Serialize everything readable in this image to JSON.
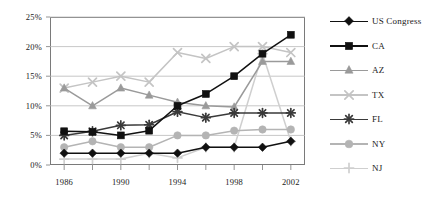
{
  "chart_data": {
    "type": "line",
    "title": "",
    "xlabel": "",
    "ylabel": "",
    "xlim": [
      1985,
      2003
    ],
    "ylim": [
      0,
      25
    ],
    "grid": true,
    "legend_position": "right",
    "x": [
      1986,
      1988,
      1990,
      1992,
      1994,
      1996,
      1998,
      2000,
      2002
    ],
    "xtick_labels": [
      "1986",
      "1990",
      "1994",
      "1998",
      "2002"
    ],
    "xtick_values": [
      1986,
      1990,
      1994,
      1998,
      2002
    ],
    "ytick_labels": [
      "0%",
      "5%",
      "10%",
      "15%",
      "20%",
      "25%"
    ],
    "ytick_values": [
      0,
      5,
      10,
      15,
      20,
      25
    ],
    "series": [
      {
        "name": "US Congress",
        "color": "#111111",
        "marker": "diamond",
        "values": [
          2.0,
          2.0,
          2.0,
          2.0,
          2.0,
          3.0,
          3.0,
          3.0,
          4.0
        ]
      },
      {
        "name": "CA",
        "color": "#111111",
        "marker": "square",
        "values": [
          5.7,
          5.6,
          5.0,
          5.8,
          10.0,
          12.0,
          15.0,
          18.8,
          22.0
        ]
      },
      {
        "name": "AZ",
        "color": "#9a9a9a",
        "marker": "triangle",
        "values": [
          13.0,
          10.0,
          13.0,
          11.8,
          10.6,
          10.0,
          9.8,
          17.5,
          17.5
        ]
      },
      {
        "name": "TX",
        "color": "#c4c4c4",
        "marker": "cross-x",
        "values": [
          13.0,
          14.0,
          15.0,
          14.0,
          19.0,
          18.0,
          20.0,
          20.0,
          19.0
        ]
      },
      {
        "name": "FL",
        "color": "#3a3a3a",
        "marker": "asterisk",
        "values": [
          5.0,
          5.7,
          6.7,
          6.8,
          9.0,
          8.0,
          8.8,
          8.8,
          8.8
        ]
      },
      {
        "name": "NY",
        "color": "#b4b4b4",
        "marker": "circle",
        "values": [
          3.0,
          4.0,
          3.0,
          3.0,
          5.0,
          5.0,
          5.8,
          6.0,
          6.0
        ]
      },
      {
        "name": "NJ",
        "color": "#cfcfcf",
        "marker": "plus",
        "values": [
          1.0,
          1.0,
          1.0,
          2.0,
          1.2,
          3.0,
          3.0,
          18.8,
          4.0
        ]
      }
    ]
  },
  "legend": {
    "items": [
      {
        "label": "US Congress"
      },
      {
        "label": "CA"
      },
      {
        "label": "AZ"
      },
      {
        "label": "TX"
      },
      {
        "label": "FL"
      },
      {
        "label": "NY"
      },
      {
        "label": "NJ"
      }
    ]
  }
}
